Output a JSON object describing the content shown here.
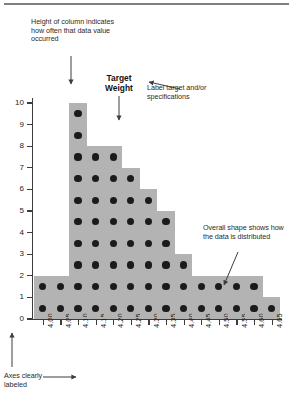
{
  "figure": {
    "annotations": {
      "height_note": "Height of column indicates how often that data value occurred",
      "target_label": "Target Weight",
      "spec_note": "Label target and/or specifications",
      "shape_note": "Overall shape shows how the data is distributed",
      "axes_note": "Axes clearly labeled"
    },
    "colors": {
      "bar_fill": "#b3b3b3",
      "dot": "#1b1b1b",
      "axis": "#3c3c3c",
      "text": "#232323",
      "rule": "#7f7f7f"
    }
  },
  "chart_data": {
    "type": "bar",
    "title": "",
    "subtitle": "",
    "xlabel": "",
    "ylabel": "",
    "categories": [
      "4.00",
      "4.05",
      "4.10",
      "4.15",
      "4.20",
      "4.25",
      "4.30",
      "4.35",
      "4.40",
      "4.45",
      "4.50",
      "4.55",
      "4.60",
      "4.65"
    ],
    "values": [
      2,
      2,
      10,
      8,
      8,
      7,
      6,
      5,
      3,
      2,
      2,
      2,
      2,
      1
    ],
    "ylim": [
      0,
      10
    ],
    "yticks": [
      0,
      1,
      2,
      3,
      4,
      5,
      6,
      7,
      8,
      9,
      10
    ],
    "ytick_labels": [
      "0",
      "1",
      "2",
      "3",
      "4",
      "5",
      "6",
      "7",
      "8",
      "9",
      "10"
    ],
    "grid": false,
    "legend": false,
    "marker": "filled-circle-per-count",
    "target_category": "4.20"
  }
}
